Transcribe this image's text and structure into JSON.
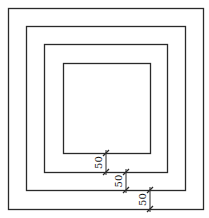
{
  "diagram": {
    "type": "concentric-squares",
    "stroke_color": "#2a2a2a",
    "squares": [
      {
        "name": "outer-square",
        "x": 8,
        "y": 8,
        "w": 195,
        "h": 201
      },
      {
        "name": "second-square",
        "x": 26,
        "y": 26,
        "w": 159,
        "h": 164
      },
      {
        "name": "third-square",
        "x": 44,
        "y": 44,
        "w": 123,
        "h": 128
      },
      {
        "name": "inner-square",
        "x": 63,
        "y": 63,
        "w": 87,
        "h": 90
      }
    ],
    "dimensions": [
      {
        "label": "50",
        "x": 106,
        "y1": 153,
        "y2": 172
      },
      {
        "label": "50",
        "x": 126,
        "y1": 172,
        "y2": 190
      },
      {
        "label": "50",
        "x": 150,
        "y1": 190,
        "y2": 209
      }
    ]
  }
}
